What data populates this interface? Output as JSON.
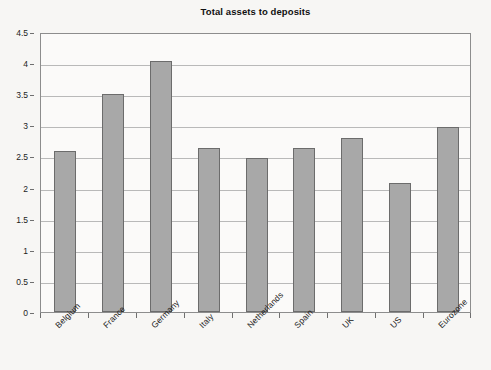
{
  "chart_data": {
    "type": "bar",
    "title": "Total assets to deposits",
    "xlabel": "",
    "ylabel": "",
    "categories": [
      "Belgium",
      "France",
      "Germany",
      "Italy",
      "Netherlands",
      "Spain",
      "UK",
      "US",
      "Eurozone"
    ],
    "values": [
      2.58,
      3.5,
      4.03,
      2.64,
      2.47,
      2.64,
      2.8,
      2.08,
      2.97
    ],
    "ylim": [
      0,
      4.5
    ],
    "ytick_labels": [
      "0",
      "0.5",
      "1",
      "1.5",
      "2",
      "2.5",
      "3",
      "3.5",
      "4",
      "4.5"
    ],
    "ytick_values": [
      0,
      0.5,
      1,
      1.5,
      2,
      2.5,
      3,
      3.5,
      4,
      4.5
    ],
    "grid": true,
    "legend": false,
    "legend_position": "none",
    "series": [
      {
        "name": "Total assets to deposits",
        "values": [
          2.58,
          3.5,
          4.03,
          2.64,
          2.47,
          2.64,
          2.8,
          2.08,
          2.97
        ]
      }
    ],
    "colors": {
      "bar_fill": "#a8a8a8",
      "bar_border": "#6c6c6c",
      "gridline": "#b9b9b9",
      "frame": "#8d8d8d",
      "text": "#1c1c1c",
      "background": "#f7f6f4",
      "plot_background": "#fbfaf9"
    }
  }
}
